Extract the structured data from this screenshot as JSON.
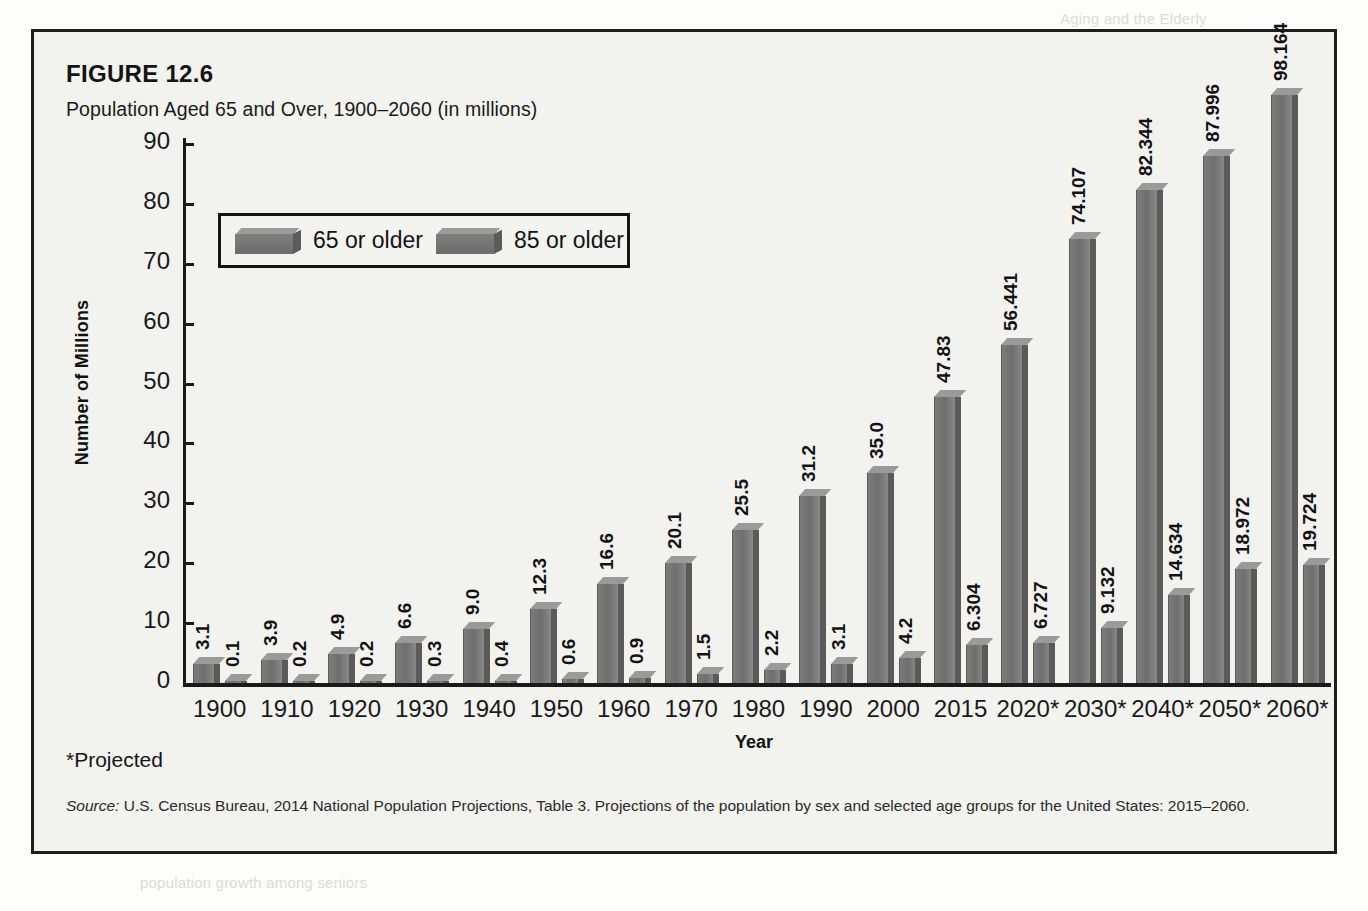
{
  "figure": {
    "number": "FIGURE 12.6",
    "title": "Population Aged 65 and Over, 1900–2060 (in millions)",
    "projected_note": "*Projected",
    "source_label": "Source:",
    "source_text": " U.S. Census Bureau, 2014 National Population Projections, Table 3. Projections of the population by sex and selected age groups for the United States: 2015–2060."
  },
  "legend": {
    "items": [
      {
        "label": "65 or older",
        "color": "#6e6e6e"
      },
      {
        "label": "85 or older",
        "color": "#6e6e6e"
      }
    ]
  },
  "axes": {
    "ylabel": "Number of Millions",
    "xlabel": "Year",
    "yticks": [
      "0",
      "10",
      "20",
      "30",
      "40",
      "50",
      "60",
      "70",
      "80",
      "90"
    ]
  },
  "chart_data": {
    "type": "bar",
    "title": "Population Aged 65 and Over, 1900–2060 (in millions)",
    "xlabel": "Year",
    "ylabel": "Number of Millions",
    "ylim": [
      0,
      90
    ],
    "ytick_step": 10,
    "grid": false,
    "legend_position": "inside-upper-left",
    "categories": [
      "1900",
      "1910",
      "1920",
      "1930",
      "1940",
      "1950",
      "1960",
      "1970",
      "1980",
      "1990",
      "2000",
      "2015",
      "2020*",
      "2030*",
      "2040*",
      "2050*",
      "2060*"
    ],
    "series": [
      {
        "name": "65 or older",
        "values": [
          3.1,
          3.9,
          4.9,
          6.6,
          9.0,
          12.3,
          16.6,
          20.1,
          25.5,
          31.2,
          35.0,
          47.83,
          56.441,
          74.107,
          82.344,
          87.996,
          98.164
        ],
        "labels": [
          "3.1",
          "3.9",
          "4.9",
          "6.6",
          "9.0",
          "12.3",
          "16.6",
          "20.1",
          "25.5",
          "31.2",
          "35.0",
          "47.83",
          "56.441",
          "74.107",
          "82.344",
          "87.996",
          "98.164"
        ]
      },
      {
        "name": "85 or older",
        "values": [
          0.1,
          0.2,
          0.2,
          0.3,
          0.4,
          0.6,
          0.9,
          1.5,
          2.2,
          3.1,
          4.2,
          6.304,
          6.727,
          9.132,
          14.634,
          18.972,
          19.724
        ],
        "labels": [
          "0.1",
          "0.2",
          "0.2",
          "0.3",
          "0.4",
          "0.6",
          "0.9",
          "1.5",
          "2.2",
          "3.1",
          "4.2",
          "6.304",
          "6.727",
          "9.132",
          "14.634",
          "18.972",
          "19.724"
        ]
      }
    ]
  }
}
